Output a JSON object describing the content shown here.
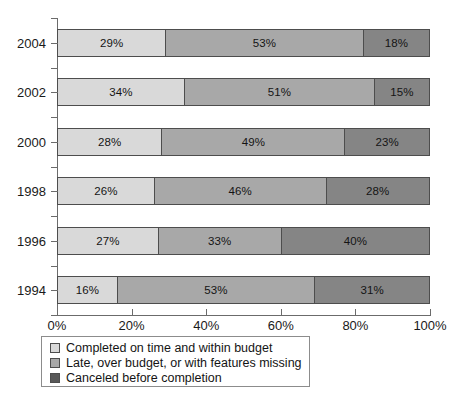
{
  "chart_data": {
    "type": "bar",
    "orientation": "horizontal",
    "stacked": true,
    "stacked_normalized": true,
    "title": "",
    "subtitle": "",
    "xlabel": "",
    "ylabel": "",
    "xlim": [
      0,
      100
    ],
    "xticks": [
      0,
      20,
      40,
      60,
      80,
      100
    ],
    "xtick_labels": [
      "0%",
      "20%",
      "40%",
      "60%",
      "80%",
      "100%"
    ],
    "grid": false,
    "legend_position": "bottom-left",
    "categories": [
      "2004",
      "2002",
      "2000",
      "1998",
      "1996",
      "1994"
    ],
    "series": [
      {
        "name": "Completed on time and within budget",
        "color": "#d9d9d9",
        "values": [
          29,
          34,
          28,
          26,
          27,
          16
        ],
        "labels": [
          "29%",
          "34%",
          "28%",
          "26%",
          "27%",
          "16%"
        ]
      },
      {
        "name": "Late, over budget, or with features missing",
        "color": "#a8a8a8",
        "values": [
          53,
          51,
          49,
          46,
          33,
          53
        ],
        "labels": [
          "53%",
          "51%",
          "49%",
          "46%",
          "33%",
          "53%"
        ]
      },
      {
        "name": "Canceled before completion",
        "color": "#858585",
        "values": [
          18,
          15,
          23,
          28,
          40,
          31
        ],
        "labels": [
          "18%",
          "15%",
          "23%",
          "28%",
          "40%",
          "31%"
        ]
      }
    ]
  },
  "axis": {
    "y_tick_labels": [
      "2004",
      "2002",
      "2000",
      "1998",
      "1996",
      "1994"
    ],
    "x_tick_labels": [
      "0%",
      "20%",
      "40%",
      "60%",
      "80%",
      "100%"
    ]
  },
  "legend": {
    "items": [
      {
        "label": "Completed on time and within budget",
        "color": "#d9d9d9"
      },
      {
        "label": "Late, over budget, or with features missing",
        "color": "#a8a8a8"
      },
      {
        "label": "Canceled before completion",
        "color": "#585858"
      }
    ]
  },
  "colors": {
    "series_light": "#d9d9d9",
    "series_medium": "#a8a8a8",
    "series_dark": "#858585",
    "legend_dark_swatch": "#585858",
    "axis": "#6b6b6b",
    "bar_border": "#4d4d4d",
    "text": "#1a1a1a",
    "background": "#ffffff"
  }
}
